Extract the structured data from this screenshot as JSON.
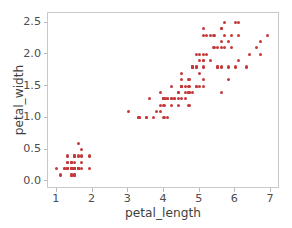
{
  "chart_data": {
    "type": "scatter",
    "title": "",
    "xlabel": "petal_length",
    "ylabel": "petal_width",
    "xlim": [
      0.75,
      7.25
    ],
    "ylim": [
      -0.12,
      2.65
    ],
    "xticks": [
      1,
      2,
      3,
      4,
      5,
      6,
      7
    ],
    "xticklabels": [
      "1",
      "2",
      "3",
      "4",
      "5",
      "6",
      "7"
    ],
    "yticks": [
      0.0,
      0.5,
      1.0,
      1.5,
      2.0,
      2.5
    ],
    "yticklabels": [
      "0.0",
      "0.5",
      "1.0",
      "1.5",
      "2.0",
      "2.5"
    ],
    "grid": false,
    "legend": null,
    "marker_color": "#c43a3a",
    "marker_size": 3,
    "frame_color": "#c9c9c9",
    "background": "#ffffff",
    "n_points": 150,
    "series": [
      {
        "name": "iris",
        "x": [
          1.4,
          1.4,
          1.3,
          1.5,
          1.4,
          1.7,
          1.4,
          1.5,
          1.4,
          1.5,
          1.5,
          1.6,
          1.4,
          1.1,
          1.2,
          1.5,
          1.3,
          1.4,
          1.7,
          1.5,
          1.7,
          1.5,
          1.0,
          1.7,
          1.9,
          1.6,
          1.6,
          1.5,
          1.4,
          1.6,
          1.6,
          1.5,
          1.5,
          1.4,
          1.5,
          1.2,
          1.3,
          1.4,
          1.3,
          1.5,
          1.3,
          1.3,
          1.3,
          1.6,
          1.9,
          1.4,
          1.6,
          1.4,
          1.5,
          1.4,
          4.7,
          4.5,
          4.9,
          4.0,
          4.6,
          4.5,
          4.7,
          3.3,
          4.6,
          3.9,
          3.5,
          4.2,
          4.0,
          4.7,
          3.6,
          4.4,
          4.5,
          4.1,
          4.5,
          3.9,
          4.8,
          4.0,
          4.9,
          4.7,
          4.3,
          4.4,
          4.8,
          5.0,
          4.5,
          3.5,
          3.8,
          3.7,
          3.9,
          5.1,
          4.5,
          4.5,
          4.7,
          4.4,
          4.1,
          4.0,
          4.4,
          4.6,
          4.0,
          3.3,
          4.2,
          4.2,
          4.2,
          4.3,
          3.0,
          4.1,
          6.0,
          5.1,
          5.9,
          5.6,
          5.8,
          6.6,
          4.5,
          6.3,
          5.8,
          6.1,
          5.1,
          5.3,
          5.5,
          5.0,
          5.1,
          5.3,
          5.5,
          6.7,
          6.9,
          5.0,
          5.7,
          4.9,
          6.7,
          4.9,
          5.7,
          6.0,
          4.8,
          4.9,
          5.6,
          5.8,
          6.1,
          6.4,
          5.6,
          5.1,
          5.6,
          6.1,
          5.6,
          5.5,
          4.8,
          5.4,
          5.6,
          5.1,
          5.1,
          5.9,
          5.7,
          5.2,
          5.0,
          5.2,
          5.4,
          5.1
        ],
        "y": [
          0.2,
          0.2,
          0.2,
          0.2,
          0.2,
          0.4,
          0.3,
          0.2,
          0.2,
          0.1,
          0.2,
          0.2,
          0.1,
          0.1,
          0.2,
          0.4,
          0.4,
          0.3,
          0.3,
          0.3,
          0.2,
          0.4,
          0.2,
          0.5,
          0.2,
          0.2,
          0.4,
          0.2,
          0.2,
          0.2,
          0.2,
          0.4,
          0.1,
          0.2,
          0.2,
          0.2,
          0.2,
          0.1,
          0.2,
          0.2,
          0.3,
          0.3,
          0.2,
          0.6,
          0.4,
          0.3,
          0.2,
          0.2,
          0.2,
          0.2,
          1.4,
          1.5,
          1.5,
          1.3,
          1.5,
          1.3,
          1.6,
          1.0,
          1.3,
          1.4,
          1.0,
          1.5,
          1.0,
          1.4,
          1.3,
          1.4,
          1.5,
          1.0,
          1.5,
          1.1,
          1.8,
          1.3,
          1.5,
          1.2,
          1.3,
          1.4,
          1.4,
          1.7,
          1.5,
          1.0,
          1.1,
          1.0,
          1.2,
          1.6,
          1.5,
          1.6,
          1.5,
          1.3,
          1.3,
          1.3,
          1.2,
          1.4,
          1.2,
          1.0,
          1.3,
          1.2,
          1.3,
          1.3,
          1.1,
          1.3,
          2.5,
          1.9,
          2.1,
          1.8,
          2.2,
          2.1,
          1.7,
          1.8,
          1.8,
          2.5,
          2.0,
          1.9,
          2.1,
          2.0,
          2.4,
          2.3,
          1.8,
          2.2,
          2.3,
          1.5,
          2.3,
          2.0,
          2.0,
          1.8,
          2.1,
          1.8,
          1.8,
          1.8,
          2.1,
          1.6,
          1.9,
          2.0,
          2.2,
          1.5,
          1.4,
          2.3,
          2.4,
          1.8,
          1.8,
          2.1,
          2.4,
          2.3,
          1.9,
          2.3,
          2.5,
          2.3,
          1.9,
          2.0,
          2.3,
          1.8
        ]
      }
    ]
  }
}
